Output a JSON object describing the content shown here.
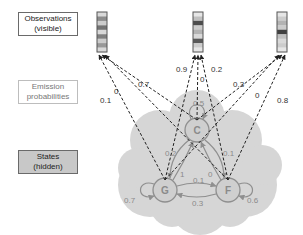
{
  "legend": {
    "observations": [
      "Observations",
      "(visible)"
    ],
    "emission": [
      "Emission",
      "probabilities"
    ],
    "states": [
      "States",
      "(hidden)"
    ]
  },
  "colors": {
    "cloud": "#d6d6d6",
    "node_fill": "#cfcfcf",
    "node_stroke": "#8f8f8f",
    "edge": "#8f8f8f",
    "dashed": "#222222"
  },
  "observations": [
    {
      "id": "obs1",
      "bands": [
        0.85,
        0.55,
        0.8,
        0.45,
        0.85,
        0.5,
        0.8,
        0.6,
        0.85
      ]
    },
    {
      "id": "obs2",
      "bands": [
        0.9,
        0.75,
        0.3,
        0.8,
        0.7,
        0.85,
        0.35,
        0.8,
        0.9
      ]
    },
    {
      "id": "obs3",
      "bands": [
        0.9,
        0.8,
        0.7,
        0.8,
        0.25,
        0.75,
        0.85,
        0.8,
        0.9
      ]
    }
  ],
  "states": [
    {
      "id": "C",
      "label": "C"
    },
    {
      "id": "G",
      "label": "G"
    },
    {
      "id": "F",
      "label": "F"
    }
  ],
  "emissions": [
    {
      "from": "G",
      "to": "obs1",
      "label": "0.1"
    },
    {
      "from": "C",
      "to": "obs1",
      "label": "0"
    },
    {
      "from": "F",
      "to": "obs1",
      "label": "0.7"
    },
    {
      "from": "G",
      "to": "obs2",
      "label": "0.9"
    },
    {
      "from": "C",
      "to": "obs2",
      "label": "0"
    },
    {
      "from": "F",
      "to": "obs2",
      "label": "0.2"
    },
    {
      "from": "G",
      "to": "obs3",
      "label": "0.3"
    },
    {
      "from": "C",
      "to": "obs3",
      "label": "0"
    },
    {
      "from": "F",
      "to": "obs3",
      "label": "0.8"
    }
  ],
  "transitions": [
    {
      "from": "C",
      "to": "C",
      "label": "0.5"
    },
    {
      "from": "G",
      "to": "G",
      "label": "0.7"
    },
    {
      "from": "F",
      "to": "F",
      "label": "0.6"
    },
    {
      "from": "C",
      "to": "G",
      "label": "0.2"
    },
    {
      "from": "G",
      "to": "C",
      "label": "1"
    },
    {
      "from": "C",
      "to": "F",
      "label": "0.1"
    },
    {
      "from": "F",
      "to": "C",
      "label": "0"
    },
    {
      "from": "G",
      "to": "F",
      "label": "0.1"
    },
    {
      "from": "F",
      "to": "G",
      "label": "0.3"
    }
  ]
}
